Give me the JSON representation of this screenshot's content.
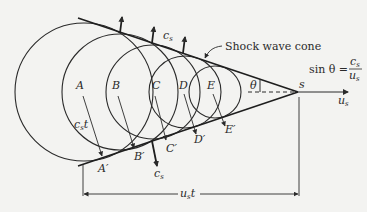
{
  "diagram": {
    "cone_label": "Shock wave cone",
    "formula": {
      "lhs": "sin θ =",
      "numerator": "c",
      "numerator_sub": "s",
      "denominator": "u",
      "denominator_sub": "s"
    },
    "apex_label": "s",
    "angle_label": "θ",
    "velocity_label": "u",
    "velocity_sub": "s",
    "wave_speed_upper": "c",
    "wave_speed_upper_sub": "s",
    "wave_speed_lower": "c",
    "wave_speed_lower_sub": "s",
    "radius_label": "c",
    "radius_sub": "s",
    "radius_t": "t",
    "distance_label": "u",
    "distance_sub": "s",
    "distance_t": "t",
    "sources": [
      {
        "label": "A",
        "tangent_label": "A′"
      },
      {
        "label": "B",
        "tangent_label": "B′"
      },
      {
        "label": "C",
        "tangent_label": "C′"
      },
      {
        "label": "D",
        "tangent_label": "D′"
      },
      {
        "label": "E",
        "tangent_label": "E′"
      }
    ]
  }
}
